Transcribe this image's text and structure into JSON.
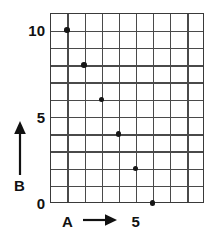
{
  "chart_data": {
    "type": "scatter",
    "title": "",
    "subtitle": "",
    "xlabel": "A",
    "ylabel": "B",
    "x": [
      1,
      2,
      3,
      4,
      5,
      6
    ],
    "values": [
      10,
      8,
      6,
      4,
      2,
      0
    ],
    "points": [
      {
        "a": 1,
        "b": 10
      },
      {
        "a": 2,
        "b": 8
      },
      {
        "a": 3,
        "b": 6
      },
      {
        "a": 4,
        "b": 4
      },
      {
        "a": 5,
        "b": 2
      },
      {
        "a": 6,
        "b": 0
      }
    ],
    "xlim": [
      0,
      9
    ],
    "ylim": [
      0,
      11
    ],
    "x_tick_labels": [
      "5"
    ],
    "x_tick_values": [
      5
    ],
    "y_tick_labels": [
      "0",
      "5",
      "10"
    ],
    "y_tick_values": [
      0,
      5,
      10
    ],
    "grid": true,
    "grid_columns": 9,
    "grid_rows": 11,
    "legend": null,
    "annotations": [],
    "marker": "filled-circle",
    "marker_color": "#161616",
    "grid_color": "#4a4a4a",
    "axis_color": "#3a3a3a",
    "background": "#ffffff"
  },
  "labels": {
    "y_top": "10",
    "y_mid": "5",
    "y_bottom": "0",
    "x_tick_five": "5",
    "x_axis_name": "A",
    "y_axis_name": "B"
  },
  "icons": {
    "x_arrow": "arrow-right-icon",
    "y_arrow": "arrow-up-icon"
  }
}
